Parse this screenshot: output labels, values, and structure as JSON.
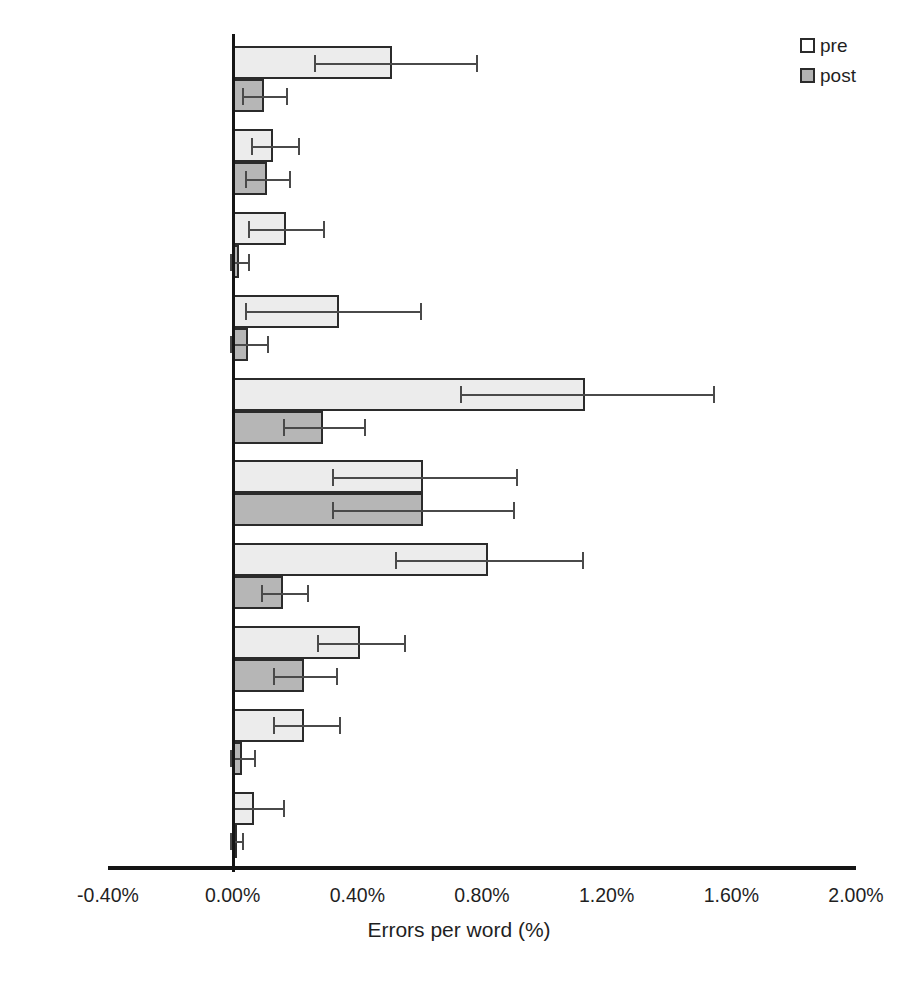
{
  "chart_data": {
    "type": "bar",
    "orientation": "horizontal",
    "title": "",
    "xlabel": "Errors per word (%)",
    "ylabel": "",
    "xlim": [
      -0.4,
      2.0
    ],
    "xticks": [
      "-0.40%",
      "0.00%",
      "0.40%",
      "0.80%",
      "1.20%",
      "1.60%",
      "2.00%"
    ],
    "xtick_values": [
      -0.4,
      0.0,
      0.4,
      0.8,
      1.2,
      1.6,
      2.0
    ],
    "grid": false,
    "legend_position": "top-right",
    "categories": [
      "verb form",
      "preposition",
      "false spell check",
      "spellcheck",
      "article",
      "voice",
      "punctuations",
      "sentence formation",
      "grammar",
      "vocabulary"
    ],
    "series": [
      {
        "name": "pre",
        "color": "#ececec",
        "values": [
          0.51,
          0.13,
          0.17,
          0.34,
          1.13,
          0.61,
          0.82,
          0.41,
          0.23,
          0.07
        ],
        "error_low": [
          0.26,
          0.06,
          0.05,
          0.04,
          0.73,
          0.32,
          0.52,
          0.27,
          0.13,
          0.0
        ],
        "error_high": [
          0.78,
          0.21,
          0.29,
          0.6,
          1.54,
          0.91,
          1.12,
          0.55,
          0.34,
          0.16
        ]
      },
      {
        "name": "post",
        "color": "#b6b6b6",
        "values": [
          0.1,
          0.11,
          0.02,
          0.05,
          0.29,
          0.61,
          0.16,
          0.23,
          0.03,
          0.01
        ],
        "error_low": [
          0.03,
          0.04,
          -0.01,
          -0.01,
          0.16,
          0.32,
          0.09,
          0.13,
          -0.01,
          -0.01
        ],
        "error_high": [
          0.17,
          0.18,
          0.05,
          0.11,
          0.42,
          0.9,
          0.24,
          0.33,
          0.07,
          0.03
        ]
      }
    ]
  },
  "legend": {
    "items": [
      {
        "label": "pre",
        "swatch": "white-square"
      },
      {
        "label": "post",
        "swatch": "gray-square"
      }
    ]
  },
  "axis": {
    "x_title": "Errors per word (%)"
  }
}
